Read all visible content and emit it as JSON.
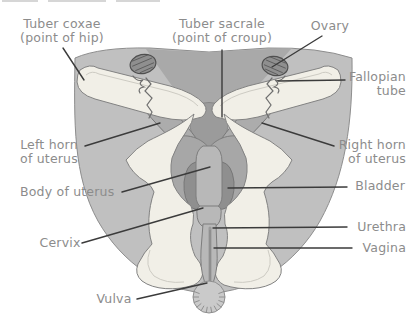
{
  "diagram": {
    "labels": {
      "tuber_coxae": {
        "lines": [
          "Tuber coxae",
          "(point of hip)"
        ]
      },
      "tuber_sacrale": {
        "lines": [
          "Tuber sacrale",
          "(point of croup)"
        ]
      },
      "ovary": {
        "lines": [
          "Ovary"
        ]
      },
      "fallopian_tube": {
        "lines": [
          "Fallopian",
          "tube"
        ]
      },
      "left_horn": {
        "lines": [
          "Left horn",
          "of uterus"
        ]
      },
      "right_horn": {
        "lines": [
          "Right horn",
          "of uterus"
        ]
      },
      "body_of_uterus": {
        "lines": [
          "Body of uterus"
        ]
      },
      "bladder": {
        "lines": [
          "Bladder"
        ]
      },
      "cervix": {
        "lines": [
          "Cervix"
        ]
      },
      "urethra": {
        "lines": [
          "Urethra"
        ]
      },
      "vagina": {
        "lines": [
          "Vagina"
        ]
      },
      "vulva": {
        "lines": [
          "Vulva"
        ]
      }
    },
    "colors": {
      "label_text": "#8c8c8c",
      "leader_line": "#3b3b3b",
      "body_fill": "#c0c0c0",
      "body_shade": "#a9a9a9",
      "bone_fill": "#f1efe7",
      "organ_fill": "#acacac",
      "organ_dark": "#8f8f8f",
      "ovary_fill": "#8f8f8f",
      "background": "#ffffff"
    }
  }
}
